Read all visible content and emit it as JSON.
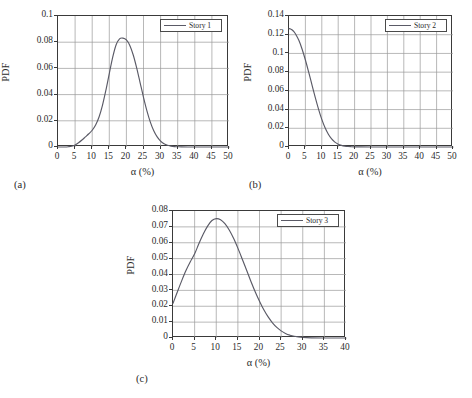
{
  "figure": {
    "background": "#ffffff",
    "curve_color": "#5a5a66",
    "grid_color": "#9a9a9a",
    "axis_color": "#3a3a3a"
  },
  "panels": [
    {
      "caption": "(a)",
      "legend_label": "Story 1",
      "xlabel": "α (%)",
      "ylabel": "PDF",
      "xticks": [
        "0",
        "5",
        "10",
        "15",
        "20",
        "25",
        "30",
        "35",
        "40",
        "45",
        "50"
      ],
      "yticks": [
        "0",
        "0.02",
        "0.04",
        "0.06",
        "0.08",
        "0.1"
      ]
    },
    {
      "caption": "(b)",
      "legend_label": "Story 2",
      "xlabel": "α (%)",
      "ylabel": "PDF",
      "xticks": [
        "0",
        "5",
        "10",
        "15",
        "20",
        "25",
        "30",
        "35",
        "40",
        "45",
        "50"
      ],
      "yticks": [
        "0",
        "0.02",
        "0.04",
        "0.06",
        "0.08",
        "0.1",
        "0.12",
        "0.14"
      ]
    },
    {
      "caption": "(c)",
      "legend_label": "Story 3",
      "xlabel": "α (%)",
      "ylabel": "PDF",
      "xticks": [
        "0",
        "5",
        "10",
        "15",
        "20",
        "25",
        "30",
        "35",
        "40"
      ],
      "yticks": [
        "0",
        "0.01",
        "0.02",
        "0.03",
        "0.04",
        "0.05",
        "0.06",
        "0.07",
        "0.08"
      ]
    }
  ],
  "chart_data": [
    {
      "type": "line",
      "panel": "(a)",
      "title": "",
      "xlabel": "α (%)",
      "ylabel": "PDF",
      "xlim": [
        0,
        50
      ],
      "ylim": [
        0,
        0.1
      ],
      "xticks": [
        0,
        5,
        10,
        15,
        20,
        25,
        30,
        35,
        40,
        45,
        50
      ],
      "yticks": [
        0,
        0.02,
        0.04,
        0.06,
        0.08,
        0.1
      ],
      "grid": true,
      "legend": [
        "Story 1"
      ],
      "legend_position": "top-right",
      "series": [
        {
          "name": "Story 1",
          "x": [
            0,
            1,
            2,
            3,
            4,
            5,
            6,
            7,
            8,
            9,
            10,
            11,
            12,
            13,
            14,
            15,
            16,
            17,
            18,
            19,
            20,
            21,
            22,
            23,
            24,
            25,
            26,
            27,
            28,
            29,
            30,
            31,
            32,
            33,
            34,
            35,
            36,
            38,
            40,
            45,
            50
          ],
          "y": [
            0.0,
            0.0,
            0.0,
            0.0002,
            0.0006,
            0.0016,
            0.0032,
            0.0053,
            0.0077,
            0.0101,
            0.0128,
            0.0168,
            0.0229,
            0.0318,
            0.0433,
            0.0561,
            0.0686,
            0.0781,
            0.0826,
            0.0831,
            0.0817,
            0.0775,
            0.0702,
            0.0604,
            0.0492,
            0.0379,
            0.0276,
            0.019,
            0.0124,
            0.0077,
            0.0045,
            0.0025,
            0.0013,
            0.0007,
            0.0003,
            0.0002,
            0.0001,
            0.0,
            0.0,
            0.0,
            0.0
          ]
        }
      ]
    },
    {
      "type": "line",
      "panel": "(b)",
      "title": "",
      "xlabel": "α (%)",
      "ylabel": "PDF",
      "xlim": [
        0,
        50
      ],
      "ylim": [
        0,
        0.14
      ],
      "xticks": [
        0,
        5,
        10,
        15,
        20,
        25,
        30,
        35,
        40,
        45,
        50
      ],
      "yticks": [
        0,
        0.02,
        0.04,
        0.06,
        0.08,
        0.1,
        0.12,
        0.14
      ],
      "grid": true,
      "legend": [
        "Story 2"
      ],
      "legend_position": "top-right",
      "series": [
        {
          "name": "Story 2",
          "x": [
            0,
            0.5,
            1,
            1.5,
            2,
            3,
            4,
            5,
            6,
            7,
            8,
            9,
            10,
            11,
            12,
            13,
            14,
            15,
            16,
            17,
            18,
            19,
            20,
            22,
            25,
            30,
            35,
            40,
            45,
            50
          ],
          "y": [
            0.1265,
            0.1262,
            0.125,
            0.1232,
            0.1208,
            0.114,
            0.1045,
            0.093,
            0.08,
            0.0665,
            0.053,
            0.0405,
            0.0295,
            0.0205,
            0.0136,
            0.0086,
            0.0052,
            0.003,
            0.0017,
            0.0009,
            0.0005,
            0.0003,
            0.0002,
            0.0001,
            0.0,
            0.0,
            0.0,
            0.0,
            0.0,
            0.0
          ]
        }
      ]
    },
    {
      "type": "line",
      "panel": "(c)",
      "title": "",
      "xlabel": "α (%)",
      "ylabel": "PDF",
      "xlim": [
        0,
        40
      ],
      "ylim": [
        0,
        0.08
      ],
      "xticks": [
        0,
        5,
        10,
        15,
        20,
        25,
        30,
        35,
        40
      ],
      "yticks": [
        0,
        0.01,
        0.02,
        0.03,
        0.04,
        0.05,
        0.06,
        0.07,
        0.08
      ],
      "grid": true,
      "legend": [
        "Story 3"
      ],
      "legend_position": "top-right",
      "series": [
        {
          "name": "Story 3",
          "x": [
            0,
            1,
            2,
            3,
            4,
            5,
            6,
            7,
            8,
            9,
            10,
            11,
            12,
            13,
            14,
            15,
            16,
            17,
            18,
            19,
            20,
            21,
            22,
            23,
            24,
            25,
            26,
            27,
            28,
            30,
            32,
            35,
            38,
            40
          ],
          "y": [
            0.0218,
            0.029,
            0.036,
            0.0425,
            0.048,
            0.053,
            0.0595,
            0.0655,
            0.0705,
            0.074,
            0.0752,
            0.0745,
            0.072,
            0.068,
            0.0628,
            0.0566,
            0.0498,
            0.0428,
            0.0358,
            0.0292,
            0.0232,
            0.0178,
            0.0133,
            0.0096,
            0.0067,
            0.0045,
            0.0029,
            0.0018,
            0.0011,
            0.0004,
            0.0001,
            0.0,
            0.0,
            0.0
          ]
        }
      ]
    }
  ]
}
